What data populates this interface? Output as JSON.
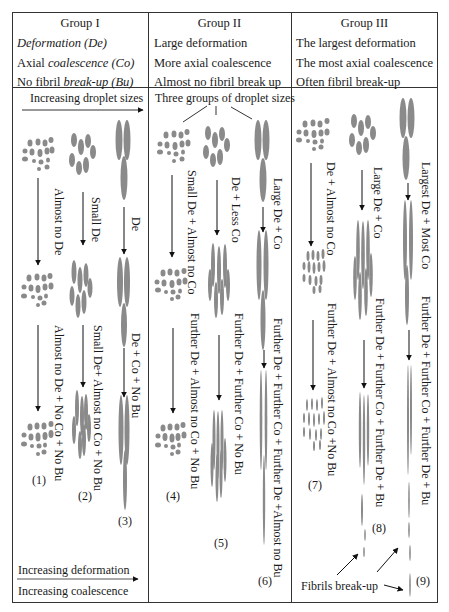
{
  "groups": [
    {
      "title": "Group I",
      "lines": [
        "Deformation (De)",
        "Axial coalescence (Co)",
        "No fibril break-up (Bu)"
      ],
      "line_parts": [
        [
          {
            "t": "Deformation (De)",
            "i": true
          }
        ],
        [
          {
            "t": "Axial ",
            "i": false
          },
          {
            "t": "coalescence (Co)",
            "i": true
          }
        ],
        [
          {
            "t": "No fibril ",
            "i": false
          },
          {
            "t": "break-up (Bu)",
            "i": true
          }
        ]
      ],
      "subheader": "Increasing droplet sizes",
      "columns": [
        {
          "step1": "Almost no De",
          "step2": "Almost no De + No Co + No Bu",
          "label": "(1)"
        },
        {
          "step1": "Small De",
          "step2": "Small De+ Almost no Co + No Bu",
          "label": "(2)"
        },
        {
          "step1": "De",
          "step2": "De + Co + No Bu",
          "label": "(3)"
        }
      ]
    },
    {
      "title": "Group  II",
      "lines": [
        "Large deformation",
        "More axial coalescence",
        "Almost no fibril break up"
      ],
      "subheader": "Three groups of droplet sizes",
      "columns": [
        {
          "step1": "Small De + Almost no Co",
          "step2": "Further De + Almost no Co + No Bu",
          "label": "(4)"
        },
        {
          "step1": "De + Less Co",
          "step2": "Further De + Further Co + No Bu",
          "label": "(5)"
        },
        {
          "step1": "Large De + Co",
          "step2": "Further De + Further Co + Further De +Almost no Bu",
          "label": "(6)"
        }
      ]
    },
    {
      "title": "Group III",
      "lines": [
        "The largest deformation",
        "The most axial coalescence",
        "Often fibril break-up"
      ],
      "subheader": "",
      "columns": [
        {
          "step1": "De + Almost no Co",
          "step2": "Further De + Almost no Co +No Bu",
          "label": "(7)"
        },
        {
          "step1": "Large De + Co",
          "step2": "Further De + Further Co + Further De + Bu",
          "label": "(8)"
        },
        {
          "step1": "Largest De + Most Co",
          "step2": "Further De + Further Co + Further De + Bu",
          "label": "(9)"
        }
      ]
    }
  ],
  "legend": {
    "top": "Increasing deformation",
    "bottom": "Increasing coalescence"
  },
  "annotation": {
    "fibrils_breakup": "Fibrils break-up"
  },
  "colors": {
    "droplet": "#8a8a8a",
    "border": "#333333",
    "text": "#1a1a1a"
  }
}
